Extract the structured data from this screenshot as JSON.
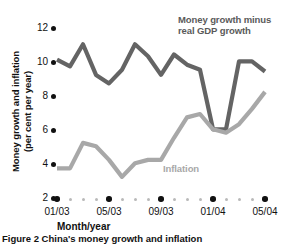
{
  "caption": "Figure 2 China's money growth and inflation",
  "axis": {
    "x_title": "Month/year",
    "y_title_line1": "Money growth and inflation",
    "y_title_line2": "(per cent per year)"
  },
  "labels": {
    "money_line1": "Money growth minus",
    "money_line2": "real GDP growth",
    "inflation": "Inflation"
  },
  "colors": {
    "money": "#646464",
    "inflation": "#a8a8a8",
    "axis": "#111111",
    "minor_tick": "#b9b9b9",
    "background": "#ffffff"
  },
  "chart_data": {
    "type": "line",
    "title": "Figure 2 China's money growth and inflation",
    "xlabel": "Month/year",
    "ylabel": "Money growth and inflation (per cent per year)",
    "ylim": [
      2,
      12
    ],
    "yticks": [
      2,
      4,
      6,
      8,
      10,
      12
    ],
    "grid": false,
    "legend": "inline-annotations",
    "x": [
      "01/03",
      "02/03",
      "03/03",
      "04/03",
      "05/03",
      "06/03",
      "07/03",
      "08/03",
      "09/03",
      "10/03",
      "11/03",
      "12/03",
      "01/04",
      "02/04",
      "03/04",
      "04/04",
      "05/04"
    ],
    "xticks_major": [
      "01/03",
      "05/03",
      "09/03",
      "01/04",
      "05/04"
    ],
    "series": [
      {
        "name": "Money growth minus real GDP growth",
        "color": "#646464",
        "values": [
          10.2,
          9.8,
          11.1,
          9.3,
          8.8,
          9.6,
          11.1,
          10.4,
          9.3,
          10.5,
          9.9,
          9.6,
          6.1,
          6.1,
          10.1,
          10.1,
          9.5
        ]
      },
      {
        "name": "Inflation",
        "color": "#a8a8a8",
        "values": [
          3.8,
          3.8,
          5.3,
          5.1,
          4.3,
          3.3,
          4.1,
          4.3,
          4.3,
          5.6,
          6.8,
          7.0,
          6.1,
          5.9,
          6.4,
          7.3,
          8.3
        ]
      }
    ]
  }
}
